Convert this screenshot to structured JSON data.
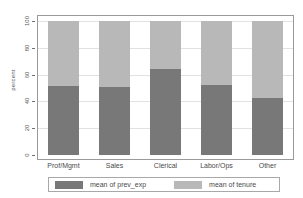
{
  "chart_data": {
    "type": "bar",
    "subtype": "stacked-percentage",
    "title": "",
    "xlabel": "",
    "ylabel": "percent",
    "ylim": [
      0,
      100
    ],
    "yticks": [
      0,
      20,
      40,
      60,
      80,
      100
    ],
    "grid": true,
    "legend_position": "bottom",
    "categories": [
      "Prof/Mgmt",
      "Sales",
      "Clerical",
      "Labor/Ops",
      "Other"
    ],
    "series": [
      {
        "name": "mean of prev_exp",
        "color": "#787878",
        "values": [
          51.5,
          50.5,
          64.0,
          52.5,
          42.5
        ]
      },
      {
        "name": "mean of tenure",
        "color": "#b8b8b8",
        "values": [
          48.5,
          49.5,
          36.0,
          47.5,
          57.5
        ]
      }
    ]
  },
  "axes": {
    "y_title": "percent",
    "y_ticks": [
      "0",
      "20",
      "40",
      "60",
      "80",
      "100"
    ]
  },
  "legend": {
    "entries": [
      {
        "label": "mean of prev_exp",
        "color": "#787878"
      },
      {
        "label": "mean of tenure",
        "color": "#b8b8b8"
      }
    ]
  },
  "colors": {
    "prev_exp": "#787878",
    "tenure": "#b8b8b8",
    "frame": "#9a9a9a",
    "grid": "#e2e2e2",
    "background": "#ffffff"
  }
}
